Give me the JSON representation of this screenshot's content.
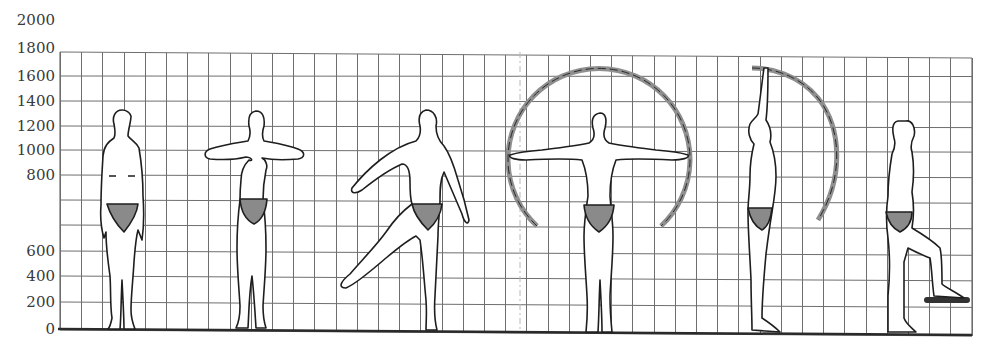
{
  "diagram": {
    "title": "",
    "type": "anthropometric-reach-diagram",
    "y_axis": {
      "unit": "mm",
      "labels": [
        {
          "text": "2000",
          "y": 20
        },
        {
          "text": "1800",
          "y": 48
        },
        {
          "text": "1600",
          "y": 76
        },
        {
          "text": "1400",
          "y": 101
        },
        {
          "text": "1200",
          "y": 126
        },
        {
          "text": "1000",
          "y": 150
        },
        {
          "text": "800",
          "y": 175
        },
        {
          "text": "600",
          "y": 251
        },
        {
          "text": "400",
          "y": 276
        },
        {
          "text": "200",
          "y": 302
        },
        {
          "text": "0",
          "y": 329
        }
      ]
    },
    "grid": {
      "left": 60,
      "right": 972,
      "top": 52,
      "bottom": 330,
      "column_spacing": 21.2,
      "row_lines_y": [
        52,
        76,
        101,
        126,
        150,
        175,
        200,
        225,
        251,
        276,
        302,
        330
      ],
      "dashed_vertical_x": 520,
      "line_color": "#6e6e6e",
      "baseline_color": "#2a2a2a"
    },
    "figures": [
      {
        "id": "standing-front",
        "pose": "standing, arms at sides, front view"
      },
      {
        "id": "arms-folded-forward",
        "pose": "standing, forearms raised horizontally, front view"
      },
      {
        "id": "leg-kick",
        "pose": "one leg extended sideways, arm raised, front view"
      },
      {
        "id": "arms-outstretched",
        "pose": "arms extended horizontally with circular reach arc"
      },
      {
        "id": "arm-overhead-side",
        "pose": "side view, arm raised overhead with reach arc"
      },
      {
        "id": "step-up-side",
        "pose": "side view, one foot raised on step"
      }
    ],
    "colors": {
      "figure_outline": "#1e1e1e",
      "shorts_fill": "#8a8a8a",
      "arc_gray": "#8f8f8f",
      "step_dark": "#333333"
    }
  }
}
